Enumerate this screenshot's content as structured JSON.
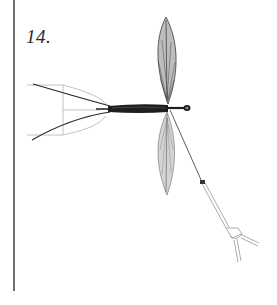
{
  "plate": {
    "number": "14."
  },
  "illustration": {
    "subject": "insect-drawing",
    "parts": [
      "head",
      "body",
      "upper-wing",
      "lower-wing",
      "antennae",
      "leg",
      "foot-clasp",
      "measurement-lines"
    ],
    "colors": {
      "ink": "#1a1a1a",
      "wing_fill": "#b9b9b9",
      "line": "#8a8a8a",
      "rule": "#6f6f6f"
    }
  }
}
